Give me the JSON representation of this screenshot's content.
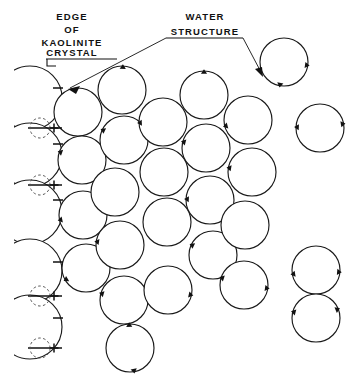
{
  "figure": {
    "background_color": "#ffffff",
    "ink_color": "#111111",
    "width": 364,
    "height": 382
  },
  "labels": {
    "edge_label": {
      "name": "edge-of-kaolinite-crystal-label",
      "lines": [
        "EDGE",
        "OF",
        "KAOLINITE",
        "CRYSTAL"
      ],
      "line1": "EDGE",
      "line2": "OF",
      "line3": "KAOLINITE",
      "line4": "CRYSTAL",
      "x": 72,
      "y": 20,
      "underline": {
        "x1": 46,
        "x2": 117,
        "y": 57
      },
      "leader": "M 47,57 L 47,63 L 55,63"
    },
    "water_label": {
      "name": "water-structure-label",
      "lines": [
        "WATER",
        "STRUCTURE"
      ],
      "line1": "WATER",
      "line2": "STRUCTURE",
      "x": 205,
      "y": 20,
      "underline": {
        "x1": 166,
        "x2": 243,
        "y": 37
      },
      "arrows": [
        {
          "name": "water-arrow-left",
          "path": "M 166,37 L 71,88",
          "tip": "M 71,88 L 80,85 L 78,92 Z"
        },
        {
          "name": "water-arrow-right",
          "path": "M 243,37 L 262,73",
          "tip": "M 262,73 L 255,68 L 261,66 Z"
        }
      ]
    }
  },
  "legend_symbols": {
    "negative_sign": "−",
    "positive_sign": "+",
    "negative_meaning": "negative charge on kaolinite crystal edge",
    "positive_meaning": "positive charge (exchangeable cation) site",
    "dipole_meaning": "water dipole orientation tick"
  },
  "crystal_edge": {
    "name": "crystal-edge-column",
    "description": "Clipped water molecules bonded to the kaolinite crystal edge at the left margin",
    "clip_x": 14,
    "circles": [
      {
        "cx": 30,
        "cy": 98,
        "r": 32
      },
      {
        "cx": 30,
        "cy": 155,
        "r": 32
      },
      {
        "cx": 30,
        "cy": 212,
        "r": 32
      },
      {
        "cx": 30,
        "cy": 271,
        "r": 32
      },
      {
        "cx": 30,
        "cy": 327,
        "r": 32
      }
    ],
    "negative_signs": [
      {
        "x": 58,
        "y": 88
      },
      {
        "x": 58,
        "y": 144
      },
      {
        "x": 58,
        "y": 200
      },
      {
        "x": 58,
        "y": 262
      },
      {
        "x": 58,
        "y": 318
      }
    ],
    "positive_sites": [
      {
        "cx": 40,
        "cy": 128,
        "r": 10,
        "sign_x": 54,
        "sign_y": 128
      },
      {
        "cx": 40,
        "cy": 185,
        "r": 10,
        "sign_x": 54,
        "sign_y": 185
      },
      {
        "cx": 40,
        "cy": 296,
        "r": 10,
        "sign_x": 54,
        "sign_y": 296
      },
      {
        "cx": 40,
        "cy": 348,
        "r": 10,
        "sign_x": 54,
        "sign_y": 348
      }
    ],
    "bond_bars": [
      {
        "x1": 28,
        "y1": 128,
        "x2": 62,
        "y2": 128
      },
      {
        "x1": 28,
        "y1": 185,
        "x2": 62,
        "y2": 185
      },
      {
        "x1": 28,
        "y1": 296,
        "x2": 62,
        "y2": 296
      },
      {
        "x1": 28,
        "y1": 348,
        "x2": 62,
        "y2": 348
      }
    ]
  },
  "water_molecules": {
    "name": "water-molecule-circles",
    "radius": 24,
    "count": 26,
    "items": [
      {
        "id": "w1",
        "cx": 78,
        "cy": 112,
        "ticks": []
      },
      {
        "id": "w2",
        "cx": 82,
        "cy": 160,
        "ticks": [
          200
        ]
      },
      {
        "id": "w3",
        "cx": 83,
        "cy": 215,
        "ticks": [
          168
        ]
      },
      {
        "id": "w4",
        "cx": 86,
        "cy": 268,
        "ticks": [
          150
        ]
      },
      {
        "id": "w5",
        "cx": 122,
        "cy": 90,
        "ticks": [
          272
        ]
      },
      {
        "id": "w6",
        "cx": 124,
        "cy": 140,
        "ticks": [
          205
        ]
      },
      {
        "id": "w7",
        "cx": 115,
        "cy": 192,
        "ticks": []
      },
      {
        "id": "w8",
        "cx": 120,
        "cy": 245,
        "ticks": [
          188
        ]
      },
      {
        "id": "w9",
        "cx": 124,
        "cy": 300,
        "ticks": [
          196
        ]
      },
      {
        "id": "w10",
        "cx": 130,
        "cy": 348,
        "ticks": [
          268,
          80
        ]
      },
      {
        "id": "w11",
        "cx": 163,
        "cy": 122,
        "ticks": [
          178
        ]
      },
      {
        "id": "w12",
        "cx": 164,
        "cy": 172,
        "ticks": []
      },
      {
        "id": "w13",
        "cx": 167,
        "cy": 222,
        "ticks": []
      },
      {
        "id": "w14",
        "cx": 168,
        "cy": 290,
        "ticks": [
          12
        ]
      },
      {
        "id": "w15",
        "cx": 204,
        "cy": 95,
        "ticks": [
          270
        ]
      },
      {
        "id": "w16",
        "cx": 206,
        "cy": 148,
        "ticks": [
          195
        ]
      },
      {
        "id": "w17",
        "cx": 210,
        "cy": 200,
        "ticks": [
          182
        ]
      },
      {
        "id": "w18",
        "cx": 213,
        "cy": 255,
        "ticks": [
          205
        ]
      },
      {
        "id": "w19",
        "cx": 248,
        "cy": 120,
        "ticks": [
          165
        ]
      },
      {
        "id": "w20",
        "cx": 252,
        "cy": 172,
        "ticks": [
          190
        ]
      },
      {
        "id": "w21",
        "cx": 245,
        "cy": 225,
        "ticks": []
      },
      {
        "id": "w22",
        "cx": 244,
        "cy": 285,
        "ticks": [
          198,
          8
        ]
      },
      {
        "id": "w23",
        "cx": 284,
        "cy": 62,
        "ticks": [
          8,
          100
        ]
      },
      {
        "id": "w24",
        "cx": 320,
        "cy": 128,
        "ticks": [
          350,
          182
        ]
      },
      {
        "id": "w25",
        "cx": 316,
        "cy": 270,
        "ticks": [
          5,
          170
        ]
      },
      {
        "id": "w26",
        "cx": 316,
        "cy": 318,
        "ticks": [
          195,
          338
        ]
      }
    ]
  }
}
